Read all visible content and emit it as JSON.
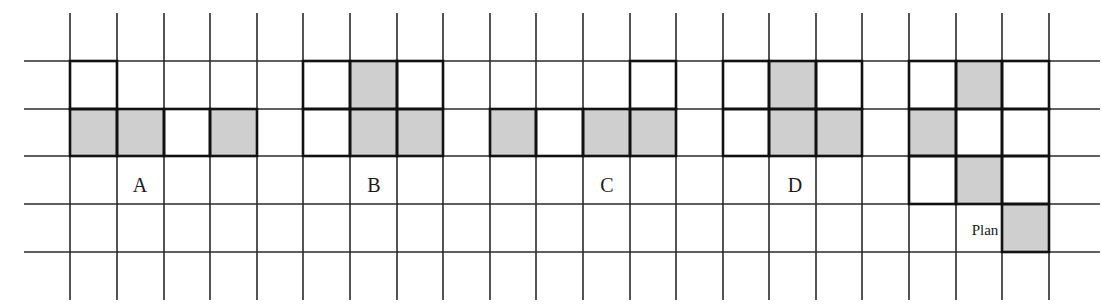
{
  "figure": {
    "colors": {
      "grid_line": "#2a2a2a",
      "bold_line": "#111111",
      "shaded_fill": "#cfcfcf",
      "background": "#ffffff"
    },
    "grid": {
      "column_lines_x": [
        70,
        117,
        164,
        210,
        257,
        303,
        350,
        397,
        443,
        490,
        536,
        583,
        630,
        676,
        723,
        769,
        816,
        862,
        909,
        956,
        1002,
        1049
      ],
      "row_lines_y": [
        61,
        109,
        156,
        204,
        252
      ],
      "vertical_extent": [
        13,
        300
      ],
      "horizontal_extent": [
        24,
        1100
      ]
    },
    "options": [
      {
        "label": "A",
        "label_pos": [
          140,
          192
        ],
        "cells": [
          {
            "col": 0,
            "row": 0,
            "shaded": false
          },
          {
            "col": 0,
            "row": 1,
            "shaded": true
          },
          {
            "col": 1,
            "row": 1,
            "shaded": true
          },
          {
            "col": 2,
            "row": 1,
            "shaded": false
          },
          {
            "col": 3,
            "row": 1,
            "shaded": true
          }
        ]
      },
      {
        "label": "B",
        "label_pos": [
          374,
          192
        ],
        "cells": [
          {
            "col": 5,
            "row": 0,
            "shaded": false
          },
          {
            "col": 6,
            "row": 0,
            "shaded": true
          },
          {
            "col": 7,
            "row": 0,
            "shaded": false
          },
          {
            "col": 5,
            "row": 1,
            "shaded": false
          },
          {
            "col": 6,
            "row": 1,
            "shaded": true
          },
          {
            "col": 7,
            "row": 1,
            "shaded": true
          }
        ]
      },
      {
        "label": "C",
        "label_pos": [
          607,
          192
        ],
        "cells": [
          {
            "col": 12,
            "row": 0,
            "shaded": false
          },
          {
            "col": 9,
            "row": 1,
            "shaded": true
          },
          {
            "col": 10,
            "row": 1,
            "shaded": false
          },
          {
            "col": 11,
            "row": 1,
            "shaded": true
          },
          {
            "col": 12,
            "row": 1,
            "shaded": true
          }
        ]
      },
      {
        "label": "D",
        "label_pos": [
          795,
          192
        ],
        "cells": [
          {
            "col": 14,
            "row": 0,
            "shaded": false
          },
          {
            "col": 15,
            "row": 0,
            "shaded": true
          },
          {
            "col": 16,
            "row": 0,
            "shaded": false
          },
          {
            "col": 14,
            "row": 1,
            "shaded": false
          },
          {
            "col": 15,
            "row": 1,
            "shaded": true
          },
          {
            "col": 16,
            "row": 1,
            "shaded": true
          }
        ]
      },
      {
        "label": "Plan",
        "label_pos": [
          985,
          235
        ],
        "cells": [
          {
            "col": 18,
            "row": 0,
            "shaded": false
          },
          {
            "col": 19,
            "row": 0,
            "shaded": true
          },
          {
            "col": 20,
            "row": 0,
            "shaded": false
          },
          {
            "col": 18,
            "row": 1,
            "shaded": true
          },
          {
            "col": 19,
            "row": 1,
            "shaded": false
          },
          {
            "col": 20,
            "row": 1,
            "shaded": false
          },
          {
            "col": 18,
            "row": 2,
            "shaded": false
          },
          {
            "col": 19,
            "row": 2,
            "shaded": true
          },
          {
            "col": 20,
            "row": 2,
            "shaded": false
          },
          {
            "col": 20,
            "row": 3,
            "shaded": true
          }
        ]
      }
    ]
  }
}
